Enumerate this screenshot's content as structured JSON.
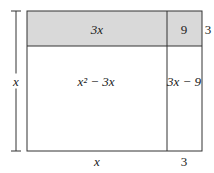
{
  "diagram": {
    "type": "area-model-rectangle",
    "colors": {
      "shaded": "#d9d9d9",
      "line": "#333333",
      "background": "#ffffff"
    },
    "regions": {
      "top_left": {
        "label": "3x",
        "shaded": true
      },
      "top_right": {
        "label": "9",
        "shaded": true
      },
      "bottom_left": {
        "label": "x² − 3x",
        "shaded": false
      },
      "bottom_right": {
        "label": "3x − 9",
        "shaded": false
      }
    },
    "dimensions": {
      "left_side": "x",
      "right_top": "3",
      "bottom_left": "x",
      "bottom_right": "3"
    }
  }
}
